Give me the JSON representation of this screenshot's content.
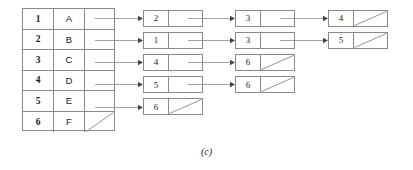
{
  "figure": {
    "caption": "(c)",
    "stroke_color": "#8a8a8a",
    "text_color": "#1a1a1a",
    "background_color": "#ffffff"
  },
  "table": {
    "rows": [
      {
        "index": "1",
        "name": "A",
        "null_pointer": false
      },
      {
        "index": "2",
        "name": "B",
        "null_pointer": false
      },
      {
        "index": "3",
        "name": "C",
        "null_pointer": false
      },
      {
        "index": "4",
        "name": "D",
        "null_pointer": false
      },
      {
        "index": "5",
        "name": "E",
        "null_pointer": false
      },
      {
        "index": "6",
        "name": "F",
        "null_pointer": true
      }
    ]
  },
  "adjacency_lists": [
    {
      "source": "1",
      "nodes": [
        "2",
        "3",
        "4"
      ]
    },
    {
      "source": "2",
      "nodes": [
        "1",
        "3",
        "5"
      ]
    },
    {
      "source": "3",
      "nodes": [
        "4",
        "6"
      ]
    },
    {
      "source": "4",
      "nodes": [
        "5",
        "6"
      ]
    },
    {
      "source": "5",
      "nodes": [
        "6"
      ]
    },
    {
      "source": "6",
      "nodes": []
    }
  ]
}
